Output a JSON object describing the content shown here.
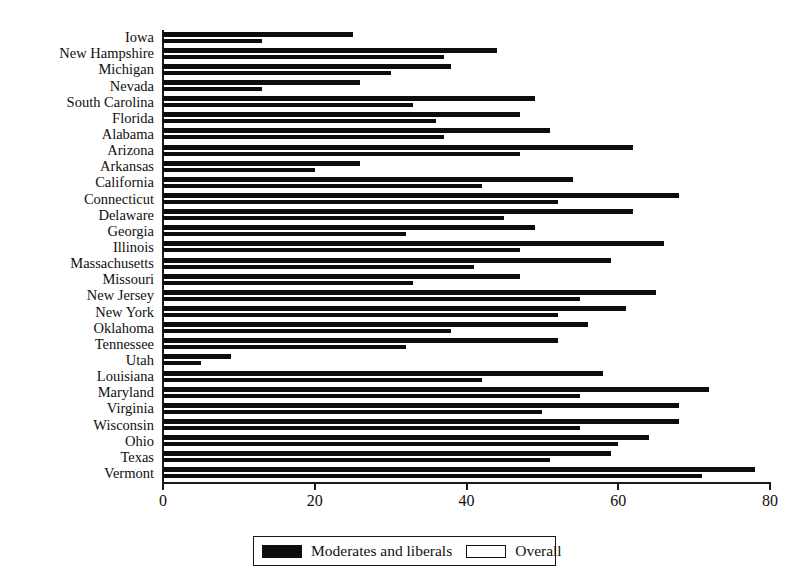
{
  "chart_data": {
    "type": "bar",
    "orientation": "horizontal",
    "title": "",
    "subtitle": "",
    "xlabel": "",
    "ylabel": "",
    "xlim": [
      0,
      80
    ],
    "xticks": [
      0,
      20,
      40,
      60,
      80
    ],
    "xticklabels": [
      "0",
      "20",
      "40",
      "60",
      "80"
    ],
    "grid": false,
    "legend_position": "bottom-center",
    "categories": [
      "Iowa",
      "New Hampshire",
      "Michigan",
      "Nevada",
      "South Carolina",
      "Florida",
      "Alabama",
      "Arizona",
      "Arkansas",
      "California",
      "Connecticut",
      "Delaware",
      "Georgia",
      "Illinois",
      "Massachusetts",
      "Missouri",
      "New Jersey",
      "New York",
      "Oklahoma",
      "Tennessee",
      "Utah",
      "Louisiana",
      "Maryland",
      "Virginia",
      "Wisconsin",
      "Ohio",
      "Texas",
      "Vermont"
    ],
    "series": [
      {
        "name": "Overall",
        "color": "#0d0d0d",
        "style": "open-swatch",
        "values": [
          25,
          44,
          38,
          26,
          49,
          47,
          51,
          62,
          26,
          54,
          68,
          62,
          49,
          66,
          59,
          47,
          65,
          61,
          56,
          52,
          9,
          58,
          72,
          68,
          68,
          64,
          59,
          78
        ]
      },
      {
        "name": "Moderates and liberals",
        "color": "#0d0d0d",
        "style": "filled-swatch",
        "values": [
          13,
          37,
          30,
          13,
          33,
          36,
          37,
          47,
          20,
          42,
          52,
          45,
          32,
          47,
          41,
          33,
          55,
          52,
          38,
          32,
          5,
          42,
          55,
          50,
          55,
          60,
          51,
          71
        ]
      }
    ]
  },
  "legend": {
    "items": [
      {
        "label": "Moderates and liberals",
        "swatch": "filled"
      },
      {
        "label": "Overall",
        "swatch": "open"
      }
    ]
  }
}
